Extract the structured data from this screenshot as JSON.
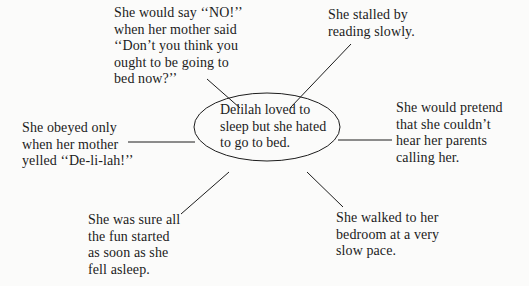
{
  "diagram": {
    "type": "web-organizer",
    "center": {
      "text": "Delilah loved to\nsleep but she hated\nto go to bed."
    },
    "branches": [
      {
        "id": "top-left",
        "text": "She would say ‘‘NO!’’\nwhen her mother said\n‘‘Don’t you think you\nought to be going to\nbed now?’’"
      },
      {
        "id": "top-right",
        "text": "She stalled by\nreading slowly."
      },
      {
        "id": "left",
        "text": "She obeyed only\nwhen her mother\nyelled ‘‘De-li-lah!’’"
      },
      {
        "id": "right",
        "text": "She would pretend\nthat she couldn’t\nhear her parents\ncalling her."
      },
      {
        "id": "bottom-left",
        "text": "She was sure all\nthe fun started\nas soon as she\nfell asleep."
      },
      {
        "id": "bottom-right",
        "text": "She walked to her\nbedroom at a very\nslow pace."
      }
    ]
  },
  "colors": {
    "background": "#fbfbfa",
    "ink": "#1c1c1c"
  }
}
